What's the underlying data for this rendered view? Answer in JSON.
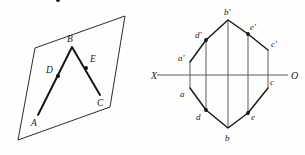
{
  "figure": {
    "background_color": "#fefefe",
    "line_color": "#111111",
    "axis_color": "#5a5a5a"
  },
  "pictorial": {
    "name": "oblique-plane-pictorial-view",
    "plane": {
      "name": "oblique-plane-quadrilateral",
      "points": "35,48 125,16 110,107 18,140"
    },
    "polyline": {
      "name": "broken-line-abc",
      "points": "38,115 72,47 100,95"
    },
    "vertices": [
      {
        "id": "A",
        "label": "A",
        "x": 38,
        "y": 115,
        "label_x": 31,
        "label_y": 126,
        "dot": false
      },
      {
        "id": "D",
        "label": "D",
        "x": 58,
        "y": 76,
        "label_x": 46,
        "label_y": 73,
        "dot": true
      },
      {
        "id": "B",
        "label": "B",
        "x": 72,
        "y": 47,
        "label_x": 67,
        "label_y": 42,
        "dot": false
      },
      {
        "id": "E",
        "label": "E",
        "x": 86,
        "y": 68,
        "label_x": 90,
        "label_y": 62,
        "dot": true
      },
      {
        "id": "C",
        "label": "C",
        "x": 100,
        "y": 95,
        "label_x": 97,
        "label_y": 106,
        "dot": false
      }
    ]
  },
  "orthographic": {
    "name": "two-view-orthographic-projection",
    "axis": {
      "name": "xo-ground-line",
      "y": 75,
      "x_start": 157,
      "x_end": 288,
      "left_label": "X",
      "left_label_x": 153,
      "left_label_y": 79,
      "right_label": "O",
      "right_label_x": 291,
      "right_label_y": 79
    },
    "front_view": {
      "name": "front-view-polyline",
      "points": "190,62 206,40 228,20 248,34 268,50",
      "vertices": [
        {
          "id": "a'",
          "label": "a'",
          "x": 190,
          "y": 62,
          "label_x": 180,
          "label_y": 60,
          "dot": false
        },
        {
          "id": "d'",
          "label": "d'",
          "x": 206,
          "y": 40,
          "label_x": 196,
          "label_y": 38,
          "dot": true
        },
        {
          "id": "b'",
          "label": "b'",
          "x": 228,
          "y": 20,
          "label_x": 224,
          "label_y": 15,
          "dot": false
        },
        {
          "id": "e'",
          "label": "e'",
          "x": 248,
          "y": 34,
          "label_x": 250,
          "label_y": 30,
          "dot": true
        },
        {
          "id": "c'",
          "label": "c'",
          "x": 268,
          "y": 50,
          "label_x": 271,
          "label_y": 48,
          "dot": false
        }
      ]
    },
    "top_view": {
      "name": "top-view-polyline",
      "points": "190,88 206,110 228,128 248,113 268,88",
      "vertices": [
        {
          "id": "a",
          "label": "a",
          "x": 190,
          "y": 88,
          "label_x": 181,
          "label_y": 96,
          "dot": false
        },
        {
          "id": "d",
          "label": "d",
          "x": 206,
          "y": 110,
          "label_x": 197,
          "label_y": 119,
          "dot": true
        },
        {
          "id": "b",
          "label": "b",
          "x": 228,
          "y": 128,
          "label_x": 225,
          "label_y": 140,
          "dot": false
        },
        {
          "id": "e",
          "label": "e",
          "x": 248,
          "y": 113,
          "label_x": 251,
          "label_y": 119,
          "dot": true
        },
        {
          "id": "c",
          "label": "c",
          "x": 268,
          "y": 88,
          "label_x": 270,
          "label_y": 84,
          "dot": false
        }
      ]
    },
    "projectors": [
      {
        "name": "projector-a",
        "x": 190,
        "y1": 62,
        "y2": 88
      },
      {
        "name": "projector-d",
        "x": 206,
        "y1": 40,
        "y2": 110
      },
      {
        "name": "projector-b",
        "x": 228,
        "y1": 20,
        "y2": 128
      },
      {
        "name": "projector-e",
        "x": 248,
        "y1": 34,
        "y2": 113
      },
      {
        "name": "projector-c",
        "x": 268,
        "y1": 50,
        "y2": 88
      }
    ]
  }
}
